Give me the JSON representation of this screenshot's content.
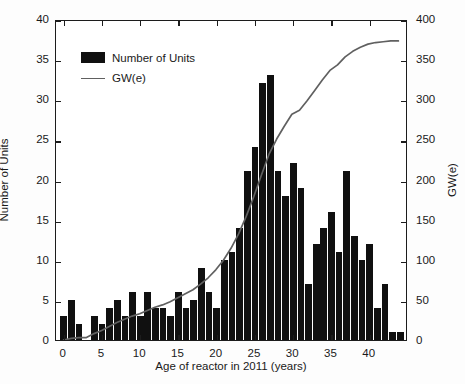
{
  "chart_data": {
    "type": "bar",
    "title": "",
    "subtitle": "",
    "xlabel": "Age of reactor in 2011 (years)",
    "ylabel": "Number of Units",
    "y2label": "GW(e)",
    "xlim": [
      -1,
      45
    ],
    "ylim": [
      0,
      40
    ],
    "y2lim": [
      0,
      400
    ],
    "grid": false,
    "legend_position": "upper-left",
    "x_ticks": [
      0,
      5,
      10,
      15,
      20,
      25,
      30,
      35,
      40
    ],
    "y_ticks": [
      0,
      5,
      10,
      15,
      20,
      25,
      30,
      35,
      40
    ],
    "y2_ticks": [
      0,
      50,
      100,
      150,
      200,
      250,
      300,
      350,
      400
    ],
    "bar_color": "#101010",
    "line_color": "#606060",
    "categories": [
      0,
      1,
      2,
      3,
      4,
      5,
      6,
      7,
      8,
      9,
      10,
      11,
      12,
      13,
      14,
      15,
      16,
      17,
      18,
      19,
      20,
      21,
      22,
      23,
      24,
      25,
      26,
      27,
      28,
      29,
      30,
      31,
      32,
      33,
      34,
      35,
      36,
      37,
      38,
      39,
      40,
      41,
      42,
      43,
      44
    ],
    "series": [
      {
        "name": "Number of Units",
        "axis": "left",
        "type": "bar",
        "values": [
          3,
          5,
          2,
          0,
          3,
          2,
          4,
          5,
          3,
          6,
          3,
          6,
          4,
          4,
          3,
          6,
          4,
          5,
          9,
          6,
          4,
          10,
          11,
          14,
          21,
          24,
          32,
          33,
          21,
          18,
          22,
          19,
          7,
          12,
          14,
          16,
          11,
          21,
          13,
          10,
          12,
          4,
          7,
          1,
          1
        ]
      },
      {
        "name": "GW(e)",
        "axis": "right",
        "type": "line",
        "values": [
          0,
          2,
          3,
          3,
          8,
          12,
          17,
          22,
          26,
          30,
          33,
          37,
          41,
          44,
          48,
          53,
          58,
          63,
          70,
          78,
          88,
          100,
          115,
          133,
          155,
          180,
          207,
          233,
          252,
          268,
          283,
          288,
          300,
          313,
          326,
          338,
          345,
          355,
          362,
          367,
          371,
          373,
          374,
          375,
          375
        ]
      }
    ],
    "legend_entries": [
      "Number of Units",
      "GW(e)"
    ]
  },
  "geometry": {
    "plot_left": 55,
    "plot_top": 20,
    "plot_width": 352,
    "plot_height": 321,
    "x_min": -1,
    "x_max": 45
  }
}
